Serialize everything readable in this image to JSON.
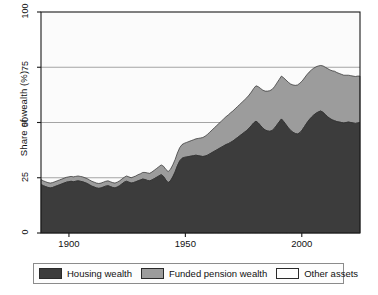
{
  "chart_data": {
    "type": "area",
    "stacked": true,
    "title": "",
    "xlabel": "",
    "ylabel": "Share of wealth (%)",
    "xlim": [
      1888,
      2025
    ],
    "ylim": [
      0,
      100
    ],
    "grid": true,
    "grid_axis": "y",
    "xticks": [
      1900,
      1950,
      2000
    ],
    "xtick_labels": [
      "1900",
      "1950",
      "2000"
    ],
    "yticks": [
      0,
      25,
      50,
      75,
      100
    ],
    "ytick_labels": [
      "0",
      "25",
      "50",
      "75",
      "100"
    ],
    "legend_position": "below",
    "colors": {
      "housing": "#3c3c3c",
      "pension": "#9c9c9c",
      "other": "#fbfbfb",
      "axis": "#1a1a1a",
      "grid": "#9a9a9a",
      "panel": "#fbfbfb"
    },
    "series": [
      {
        "name": "Housing wealth",
        "color": "#3c3c3c",
        "values": [
          22,
          21.4,
          21,
          20.6,
          20.4,
          20.6,
          21,
          21.4,
          21.8,
          22.2,
          22.6,
          23,
          23.2,
          23.4,
          23.2,
          23.4,
          23.6,
          23.4,
          23.2,
          22.8,
          22.4,
          21.8,
          21.2,
          20.8,
          20.4,
          20.2,
          20.4,
          20.8,
          21.2,
          21.4,
          21,
          20.6,
          20.4,
          20.8,
          21.4,
          22.2,
          23,
          23.4,
          23,
          22.6,
          22.8,
          23.2,
          23.6,
          24,
          24.4,
          24.2,
          23.8,
          23.6,
          24,
          24.6,
          25.2,
          25.8,
          26.4,
          25.6,
          24,
          22.8,
          23.6,
          25.4,
          27.6,
          30.4,
          32.6,
          33.8,
          34.2,
          34.4,
          34.6,
          34.8,
          35,
          35.2,
          35,
          34.8,
          34.6,
          34.8,
          35.2,
          35.8,
          36.4,
          37,
          37.6,
          38.2,
          38.8,
          39.4,
          40,
          40.4,
          41,
          41.6,
          42.4,
          43.2,
          44,
          44.8,
          45.6,
          46.4,
          47.4,
          48.6,
          49.8,
          50.6,
          49.8,
          48.6,
          47.4,
          46.6,
          46.2,
          46,
          46.4,
          47.4,
          48.8,
          50.2,
          51.6,
          50.4,
          49,
          47.6,
          46.4,
          45.6,
          45,
          44.8,
          45.4,
          46.6,
          48.2,
          49.8,
          51.2,
          52.4,
          53.4,
          54.2,
          54.8,
          55.2,
          54.6,
          53.6,
          52.6,
          51.8,
          51.2,
          50.8,
          50.4,
          50.2,
          50,
          49.8,
          50,
          50.2,
          50,
          49.8,
          49.6,
          49.8,
          50
        ]
      },
      {
        "name": "Funded pension wealth",
        "color": "#9c9c9c",
        "values": [
          2.2,
          2.2,
          2.2,
          2.2,
          2.2,
          2.2,
          2.2,
          2.2,
          2.2,
          2.2,
          2.2,
          2.2,
          2.2,
          2.2,
          2.2,
          2.2,
          2.2,
          2.2,
          2.2,
          2.2,
          2.2,
          2.2,
          2.2,
          2.2,
          2.2,
          2.2,
          2.2,
          2.2,
          2.2,
          2.2,
          2.2,
          2.2,
          2.2,
          2.2,
          2.2,
          2.2,
          2.2,
          2.4,
          2.4,
          2.4,
          2.6,
          2.6,
          2.8,
          2.8,
          3,
          3.2,
          3.4,
          3.4,
          3.6,
          3.8,
          4,
          4.2,
          4.4,
          4.6,
          4.8,
          5,
          5.2,
          5.4,
          5.6,
          5.8,
          6,
          6.2,
          6.4,
          6.6,
          6.8,
          7,
          7.2,
          7.4,
          7.8,
          8.2,
          8.6,
          9,
          9.4,
          9.8,
          10.2,
          10.6,
          11,
          11.4,
          11.8,
          12.2,
          12.6,
          13,
          13.4,
          13.6,
          13.8,
          14,
          14.2,
          14.4,
          14.6,
          14.8,
          15,
          15.2,
          15.6,
          16,
          16.4,
          16.8,
          17.2,
          17.6,
          18,
          18.4,
          18.6,
          18.8,
          19,
          19.2,
          19.4,
          19.8,
          20.2,
          20.6,
          21,
          21.4,
          21.8,
          22.2,
          22.4,
          22.2,
          22,
          21.8,
          21.6,
          21.4,
          21.2,
          21,
          20.8,
          20.6,
          21,
          21.4,
          21.8,
          22,
          22.2,
          22.4,
          22.2,
          22,
          21.8,
          21.6,
          21.4,
          21.2,
          21.2,
          21.2,
          21.2,
          21.2,
          21
        ]
      },
      {
        "name": "Other assets",
        "color": "#fbfbfb",
        "description": "remainder to 100%"
      }
    ],
    "legend": [
      "Housing wealth",
      "Funded pension wealth",
      "Other assets"
    ]
  },
  "legend": {
    "items": [
      {
        "label": "Housing wealth",
        "color": "#3c3c3c"
      },
      {
        "label": "Funded pension wealth",
        "color": "#9c9c9c"
      },
      {
        "label": "Other assets",
        "color": "#fdfdfd"
      }
    ]
  }
}
